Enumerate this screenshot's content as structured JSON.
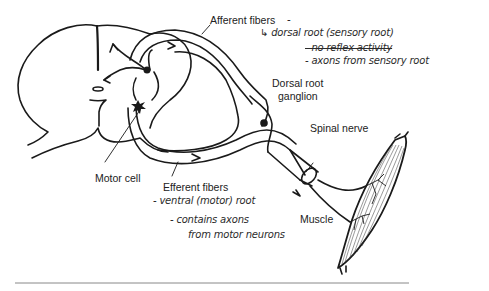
{
  "diagram": {
    "labels": {
      "afferent_fibers": "Afferent fibers",
      "dorsal_root_ganglion_line1": "Dorsal root",
      "dorsal_root_ganglion_line2": "ganglion",
      "spinal_nerve": "Spinal nerve",
      "motor_cell": "Motor cell",
      "efferent_fibers": "Efferent fibers",
      "muscle": "Muscle"
    },
    "handwritten_notes": {
      "afferent_dash": "-",
      "dorsal_root": "↳ dorsal root (sensory root)",
      "no_reflex": "- no reflex activity",
      "axons_from_sensory": "- axons from sensory root",
      "ventral_root": "- ventral (motor) root",
      "contains_axons": "- contains axons",
      "from_motor_neurons": "from motor neurons"
    },
    "colors": {
      "line": "#1a1a1a",
      "text": "#222222",
      "background": "#ffffff",
      "baseline": "#888888"
    }
  }
}
